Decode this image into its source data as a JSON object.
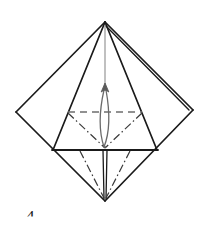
{
  "figure": {
    "kind": "origami-fold-diagram",
    "caption_number": "4",
    "background_color": "#ffffff",
    "line_color": "#1a1a1a",
    "guide_color": "#8c8c8c",
    "arrow_color": "#555555",
    "width": 210,
    "height": 228
  },
  "geometry": {
    "apex": {
      "x": 105,
      "y": 22
    },
    "left_vertex": {
      "x": 16,
      "y": 112
    },
    "right_vertex": {
      "x": 193,
      "y": 110
    },
    "bottom_vertex": {
      "x": 105,
      "y": 201
    },
    "inner_left": {
      "x": 53,
      "y": 150
    },
    "inner_right": {
      "x": 157,
      "y": 150
    },
    "fold_left": {
      "x": 68,
      "y": 112
    },
    "fold_right": {
      "x": 142,
      "y": 112
    },
    "fold_center": {
      "x": 105,
      "y": 148
    }
  },
  "strokes": {
    "outer_diamond": "Outer square rotated 45 degrees forming the base diamond",
    "inner_triangle": "Front flap triangle from apex down to the inner base corners",
    "right_layer_edge": "Double line along upper-right edge indicating a folded layer",
    "center_spine": "Thin vertical guide line running from apex through the model",
    "horizontal_crease": "Solid horizontal edge across the lower middle of the model"
  },
  "fold_marks": [
    {
      "id": "valley-horizontal",
      "label": "Valley fold",
      "style": "dashed",
      "from": {
        "x": 68,
        "y": 112
      },
      "to": {
        "x": 142,
        "y": 112
      }
    },
    {
      "id": "mountain-upper-left",
      "label": "Mountain fold",
      "style": "dash-dot",
      "from": {
        "x": 68,
        "y": 113
      },
      "to": {
        "x": 105,
        "y": 148
      }
    },
    {
      "id": "mountain-upper-right",
      "label": "Mountain fold",
      "style": "dash-dot",
      "from": {
        "x": 142,
        "y": 113
      },
      "to": {
        "x": 105,
        "y": 148
      }
    },
    {
      "id": "mountain-lower-left",
      "label": "Mountain fold",
      "style": "dash-dot",
      "from": {
        "x": 80,
        "y": 151
      },
      "to": {
        "x": 104,
        "y": 199
      }
    },
    {
      "id": "mountain-lower-right",
      "label": "Mountain fold",
      "style": "dash-dot",
      "from": {
        "x": 130,
        "y": 151
      },
      "to": {
        "x": 106,
        "y": 199
      }
    }
  ],
  "arrow": {
    "id": "fold-up-arrow",
    "label": "Fold upward",
    "direction": "up",
    "shape": "narrow-loop",
    "tip": {
      "x": 105,
      "y": 84
    },
    "tail": {
      "x": 105,
      "y": 146
    }
  }
}
